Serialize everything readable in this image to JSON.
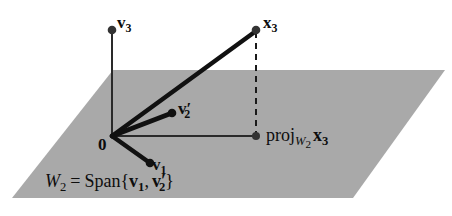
{
  "figure": {
    "background_color": "#ffffff",
    "plane_fill_color": "#a8a8a8",
    "stroke_color": "#1a1a1a"
  },
  "plane": {
    "name": "W2",
    "corners": [
      [
        113,
        70
      ],
      [
        445,
        70
      ],
      [
        353,
        198
      ],
      [
        12,
        198
      ]
    ],
    "fill": "#a9a9a9"
  },
  "points": {
    "origin": {
      "label": "0",
      "x": 112,
      "y": 136,
      "dot": false
    },
    "v3": {
      "label": "v",
      "sub": "3",
      "x": 112,
      "y": 30,
      "dot": true
    },
    "x3": {
      "label": "x",
      "sub": "3",
      "x": 256,
      "y": 30,
      "dot": true
    },
    "v2prime": {
      "label": "v",
      "sub": "2",
      "prime": "'",
      "x": 172,
      "y": 113,
      "dot": true
    },
    "v1": {
      "label": "v",
      "sub": "1",
      "x": 150,
      "y": 163,
      "dot": true
    },
    "projection": {
      "label": "proj",
      "sub": "W",
      "subsub": "2",
      "vec": "x",
      "vecsub": "3",
      "x": 256,
      "y": 136,
      "dot": true
    }
  },
  "labels": {
    "v3": {
      "base": "v",
      "subscript": "3"
    },
    "x3": {
      "base": "x",
      "subscript": "3"
    },
    "v2prime": {
      "base": "v",
      "subscript": "2",
      "prime": "′"
    },
    "v1": {
      "base": "v",
      "subscript": "1"
    },
    "origin": "0",
    "projection": {
      "operator": "proj",
      "subspace": "W",
      "subspace_sub": "2",
      "vector": "x",
      "vector_sub": "3"
    },
    "span_equation": {
      "set": "W",
      "set_sub": "2",
      "equals": "=",
      "span": "Span",
      "open": "{",
      "first": "v",
      "first_sub": "1",
      "comma": ",",
      "second": "v",
      "second_sub": "2",
      "second_prime": "′",
      "close": "}"
    }
  },
  "segments": [
    {
      "name": "v3-axis",
      "from": "origin",
      "to": "v3",
      "style": "thin-solid"
    },
    {
      "name": "x3-vector",
      "from": "origin",
      "to": "x3",
      "style": "thick-solid"
    },
    {
      "name": "v2prime-vector",
      "from": "origin",
      "to": "v2prime",
      "style": "thick-solid"
    },
    {
      "name": "v1-vector",
      "from": "origin",
      "to": "v1",
      "style": "thick-solid"
    },
    {
      "name": "projection-ray",
      "from": "origin",
      "to": "projection",
      "style": "thin-solid"
    },
    {
      "name": "drop-line",
      "from": "x3",
      "to": "projection",
      "style": "dashed"
    }
  ]
}
